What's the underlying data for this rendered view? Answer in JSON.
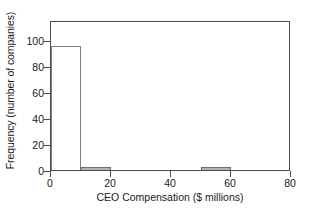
{
  "chart_data": {
    "type": "bar",
    "title": "",
    "xlabel": "CEO Compensation ($ millions)",
    "ylabel": "Frequency (number of companies)",
    "xlim": [
      0,
      80
    ],
    "ylim": [
      0,
      115
    ],
    "xticks": [
      0,
      20,
      40,
      60,
      80
    ],
    "xtick_labels": [
      "0",
      "20",
      "40",
      "60",
      "80"
    ],
    "yticks": [
      0,
      20,
      40,
      60,
      80,
      100
    ],
    "ytick_labels": [
      "0",
      "20",
      "40",
      "60",
      "80",
      "100"
    ],
    "grid": false,
    "legend": null,
    "bin_width": 10,
    "bins": [
      {
        "bin_start": 0,
        "bin_end": 10,
        "label": "0-10",
        "value": 95,
        "fill": "#ffffff",
        "edge": "#808080"
      },
      {
        "bin_start": 10,
        "bin_end": 20,
        "label": "10-20",
        "value": 2,
        "fill": "#b3b3b3",
        "edge": "#6e6e6e"
      },
      {
        "bin_start": 20,
        "bin_end": 30,
        "label": "20-30",
        "value": 0,
        "fill": "#b3b3b3",
        "edge": "#6e6e6e"
      },
      {
        "bin_start": 30,
        "bin_end": 40,
        "label": "30-40",
        "value": 0,
        "fill": "#b3b3b3",
        "edge": "#6e6e6e"
      },
      {
        "bin_start": 40,
        "bin_end": 50,
        "label": "40-50",
        "value": 0,
        "fill": "#b3b3b3",
        "edge": "#6e6e6e"
      },
      {
        "bin_start": 50,
        "bin_end": 60,
        "label": "50-60",
        "value": 2,
        "fill": "#b3b3b3",
        "edge": "#6e6e6e"
      },
      {
        "bin_start": 60,
        "bin_end": 70,
        "label": "60-70",
        "value": 0,
        "fill": "#b3b3b3",
        "edge": "#6e6e6e"
      },
      {
        "bin_start": 70,
        "bin_end": 80,
        "label": "70-80",
        "value": 0,
        "fill": "#b3b3b3",
        "edge": "#6e6e6e"
      }
    ],
    "categories": [
      "0-10",
      "10-20",
      "20-30",
      "30-40",
      "40-50",
      "50-60",
      "60-70",
      "70-80"
    ],
    "values": [
      95,
      2,
      0,
      0,
      0,
      2,
      0,
      0
    ],
    "colors": {
      "axis": "#4d4d4d",
      "frame": "#4d4d4d",
      "text": "#1a1a1a",
      "bar_fill": "#b3b3b3",
      "bar_edge": "#6e6e6e",
      "background": "#ffffff"
    }
  }
}
